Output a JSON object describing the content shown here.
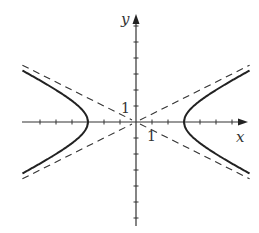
{
  "chart_data": {
    "type": "line",
    "title": "",
    "xlabel": "x",
    "ylabel": "y",
    "xlim": [
      -7.1,
      7.1
    ],
    "ylim": [
      -6.5,
      6.8
    ],
    "tick_spacing": 1,
    "tick_labels": {
      "x": "1",
      "y": "1"
    },
    "grid": false,
    "legend": null,
    "series": [
      {
        "name": "hyperbola-right-branch",
        "style": "solid",
        "equation": "x^2/9 - y^2/2.25 = 1, x > 0",
        "vertex": [
          3,
          0
        ]
      },
      {
        "name": "hyperbola-left-branch",
        "style": "solid",
        "equation": "x^2/9 - y^2/2.25 = 1, x < 0",
        "vertex": [
          -3,
          0
        ]
      },
      {
        "name": "asymptote-positive",
        "style": "dashed",
        "equation": "y = x/2"
      },
      {
        "name": "asymptote-negative",
        "style": "dashed",
        "equation": "y = -x/2"
      }
    ],
    "params": {
      "a": 3,
      "b": 1.5
    }
  },
  "render": {
    "origin": [
      136,
      122
    ],
    "unit_px": 16,
    "x_axis_px": [
      22,
      248
    ],
    "y_axis_px": [
      14,
      226
    ],
    "x_ticks": [
      -6,
      -5,
      -4,
      -3,
      -2,
      -1,
      1,
      2,
      3,
      4,
      5,
      6
    ],
    "y_ticks": [
      -6,
      -5,
      -4,
      -3,
      -2,
      -1,
      1,
      2,
      3,
      4,
      5,
      6
    ],
    "curve_color": "#222222",
    "axis_color": "#333333",
    "x_extent": 7.1
  }
}
